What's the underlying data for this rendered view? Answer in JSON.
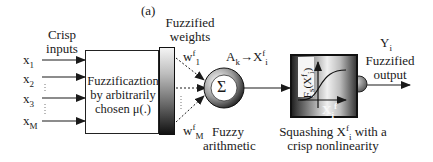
{
  "figure": {
    "panel_label": "(a)",
    "inputs": {
      "title_line1": "Crisp",
      "title_line2": "inputs",
      "items": [
        {
          "base": "x",
          "sub": "1"
        },
        {
          "base": "x",
          "sub": "2"
        },
        {
          "base": "x",
          "sub": "3"
        },
        {
          "base": "x",
          "sub": "M"
        }
      ],
      "ellipsis": "⋮"
    },
    "fuzzification": {
      "line1": "Fuzzificaztion",
      "line2": "by arbitrarily",
      "line3": "chosen μ(.)"
    },
    "weights": {
      "title_line1": "Fuzzified",
      "title_line2": "weights",
      "first": {
        "base": "w",
        "sup": "f",
        "sub": "1"
      },
      "last": {
        "base": "w",
        "sup": "f",
        "sub": "M"
      }
    },
    "summation": {
      "symbol": "Σ",
      "label_line1": "Fuzzy",
      "label_line2": "arithmetic",
      "mapping": {
        "a": "A",
        "a_sub": "k",
        "arrow": "→",
        "x": "X",
        "x_sup": "f",
        "x_sub": "i"
      }
    },
    "squashing": {
      "y_axis_label": "F",
      "y_axis_sub": "s",
      "y_axis_arg": "(X",
      "y_axis_arg_sub": "i",
      "y_axis_arg_sup": "f",
      "y_axis_close": ")",
      "x_axis": {
        "base": "X",
        "sub": "i",
        "sup": "f"
      },
      "caption_line1_pre": "Squashing ",
      "caption_var": {
        "base": "X",
        "sup": "f",
        "sub": "i"
      },
      "caption_line1_post": " with a",
      "caption_line2": "crisp nonlinearity"
    },
    "output": {
      "symbol": "Y",
      "symbol_sub": "i",
      "label_line1": "Fuzzified",
      "label_line2": "output"
    },
    "colors": {
      "line": "#1a1a1a",
      "background": "#ffffff",
      "ball": "#8a8a8a"
    }
  }
}
